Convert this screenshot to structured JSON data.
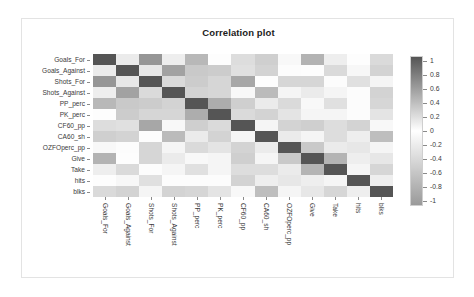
{
  "chart_data": {
    "type": "heatmap",
    "title": "Correlation plot",
    "xlabel": "",
    "ylabel": "",
    "grid": false,
    "legend_position": "right",
    "colorbar": {
      "ticks": [
        "1",
        "0.8",
        "0.6",
        "0.4",
        "0.2",
        "0",
        "-0.2",
        "-0.4",
        "-0.6",
        "-0.8",
        "-1"
      ],
      "vmin": -1,
      "vmax": 1,
      "colormap": "gray-diverging-white-center",
      "high_color": "#555555",
      "mid_color": "#ffffff",
      "low_color": "#9a9a9a"
    },
    "variables": [
      "Goals_For",
      "Goals_Against",
      "Shots_For",
      "Shots_Against",
      "PP_perc",
      "PK_perc",
      "CF60_pp",
      "CA60_sh",
      "OZFOperc_pp",
      "Give",
      "Take",
      "hits",
      "blks"
    ],
    "categories": [
      "Goals_For",
      "Goals_Against",
      "Shots_For",
      "Shots_Against",
      "PP_perc",
      "PK_perc",
      "CF60_pp",
      "CA60_sh",
      "OZFOperc_pp",
      "Give",
      "Take",
      "hits",
      "blks"
    ],
    "matrix": [
      [
        1.0,
        0.12,
        0.62,
        0.1,
        0.42,
        -0.02,
        0.2,
        0.28,
        0.04,
        0.45,
        0.1,
        0.01,
        0.22
      ],
      [
        0.12,
        1.0,
        0.14,
        0.55,
        0.32,
        0.3,
        0.18,
        0.26,
        0.02,
        0.01,
        0.22,
        0.05,
        0.26
      ],
      [
        0.62,
        0.14,
        1.0,
        0.22,
        0.3,
        0.24,
        0.52,
        -0.02,
        0.24,
        0.24,
        0.02,
        0.18,
        0.06
      ],
      [
        0.1,
        0.55,
        0.22,
        1.0,
        0.26,
        0.24,
        0.04,
        0.4,
        0.06,
        0.12,
        0.06,
        0.02,
        0.26
      ],
      [
        0.42,
        0.32,
        0.3,
        0.26,
        1.0,
        0.48,
        0.28,
        0.12,
        0.22,
        0.04,
        0.18,
        0.02,
        0.24
      ],
      [
        -0.02,
        0.3,
        0.24,
        0.24,
        0.48,
        1.0,
        0.22,
        0.26,
        0.16,
        0.06,
        0.06,
        0.02,
        0.16
      ],
      [
        0.2,
        0.18,
        0.52,
        0.04,
        0.28,
        0.22,
        1.0,
        0.06,
        0.26,
        0.28,
        0.2,
        0.26,
        0.04
      ],
      [
        0.28,
        0.26,
        -0.02,
        0.4,
        0.12,
        0.26,
        0.06,
        1.0,
        0.12,
        0.06,
        0.2,
        0.1,
        0.38
      ],
      [
        0.04,
        0.02,
        0.24,
        0.06,
        0.22,
        0.16,
        0.26,
        0.12,
        1.0,
        0.32,
        0.12,
        0.14,
        0.06
      ],
      [
        0.45,
        0.01,
        0.24,
        0.12,
        0.04,
        0.06,
        0.28,
        0.06,
        0.32,
        1.0,
        0.44,
        0.1,
        0.14
      ],
      [
        0.1,
        0.22,
        0.02,
        0.06,
        0.18,
        0.06,
        0.2,
        0.2,
        0.12,
        0.44,
        1.0,
        0.06,
        0.24
      ],
      [
        0.01,
        0.05,
        0.18,
        0.02,
        0.02,
        0.02,
        0.26,
        0.1,
        0.14,
        0.1,
        0.06,
        1.0,
        0.1
      ],
      [
        0.22,
        0.26,
        0.06,
        0.26,
        0.24,
        0.16,
        0.04,
        0.38,
        0.06,
        0.14,
        0.24,
        0.1,
        1.0
      ]
    ]
  }
}
